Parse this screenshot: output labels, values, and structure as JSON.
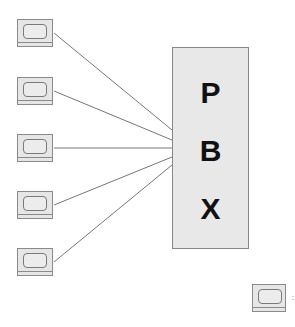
{
  "diagram": {
    "pbx": {
      "letters": [
        "P",
        "B",
        "X"
      ]
    },
    "terminals": [
      {
        "id": "terminal-1",
        "left": 17,
        "top": 19,
        "connected": true,
        "line": {
          "x1": 54,
          "y1": 33,
          "x2": 172,
          "y2": 130
        }
      },
      {
        "id": "terminal-2",
        "left": 17,
        "top": 77,
        "connected": true,
        "line": {
          "x1": 54,
          "y1": 91,
          "x2": 172,
          "y2": 140
        }
      },
      {
        "id": "terminal-3",
        "left": 17,
        "top": 134,
        "connected": true,
        "line": {
          "x1": 54,
          "y1": 148,
          "x2": 172,
          "y2": 148
        }
      },
      {
        "id": "terminal-4",
        "left": 17,
        "top": 191,
        "connected": true,
        "line": {
          "x1": 54,
          "y1": 205,
          "x2": 172,
          "y2": 157
        }
      },
      {
        "id": "terminal-5",
        "left": 17,
        "top": 248,
        "connected": true,
        "line": {
          "x1": 54,
          "y1": 262,
          "x2": 172,
          "y2": 165
        }
      },
      {
        "id": "terminal-6",
        "left": 252,
        "top": 284,
        "connected": false
      }
    ],
    "footnote_mark": ":",
    "colors": {
      "box_fill": "#e8e8e8",
      "stroke": "#888888",
      "text": "#111111"
    }
  }
}
